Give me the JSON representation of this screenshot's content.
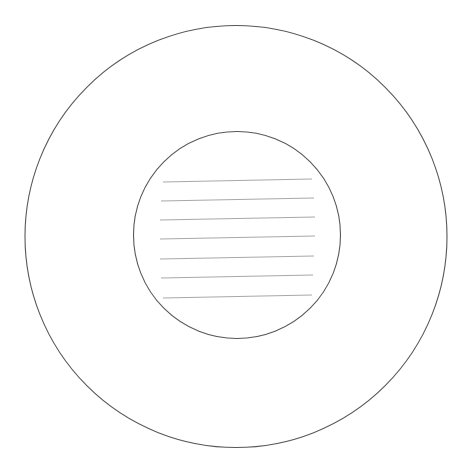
{
  "document": {
    "title": "Concentric circles line drawing",
    "width": 472,
    "height": 465,
    "background_color": "#ffffff"
  },
  "palette": {
    "background": "#ffffff",
    "circle_stroke": "#585858",
    "rule_stroke": "#a8a8a8"
  },
  "figure": {
    "name": "two concentric circles with ruled lines",
    "type": "line-drawing",
    "shapes": [
      {
        "name": "outer-circle",
        "kind": "circle",
        "cx": 236,
        "cy": 236.5,
        "r": 211,
        "fill": "none",
        "stroke": "#585858",
        "stroke_width": 1.1
      },
      {
        "name": "inner-circle",
        "kind": "circle",
        "cx": 237,
        "cy": 235,
        "r": 103.5,
        "fill": "none",
        "stroke": "#585858",
        "stroke_width": 1.1
      }
    ],
    "rule_lines": {
      "count": 7,
      "stroke": "#a8a8a8",
      "stroke_width": 1,
      "items": [
        {
          "name": "rule-line-1",
          "x1": 163,
          "y1": 182,
          "x2": 312,
          "y2": 179
        },
        {
          "name": "rule-line-2",
          "x1": 161,
          "y1": 201,
          "x2": 314,
          "y2": 198
        },
        {
          "name": "rule-line-3",
          "x1": 160,
          "y1": 220,
          "x2": 315,
          "y2": 217
        },
        {
          "name": "rule-line-4",
          "x1": 160,
          "y1": 239,
          "x2": 315,
          "y2": 236
        },
        {
          "name": "rule-line-5",
          "x1": 160,
          "y1": 259,
          "x2": 314,
          "y2": 256
        },
        {
          "name": "rule-line-6",
          "x1": 161,
          "y1": 278,
          "x2": 313,
          "y2": 275
        },
        {
          "name": "rule-line-7",
          "x1": 163,
          "y1": 298,
          "x2": 312,
          "y2": 295
        }
      ]
    }
  }
}
